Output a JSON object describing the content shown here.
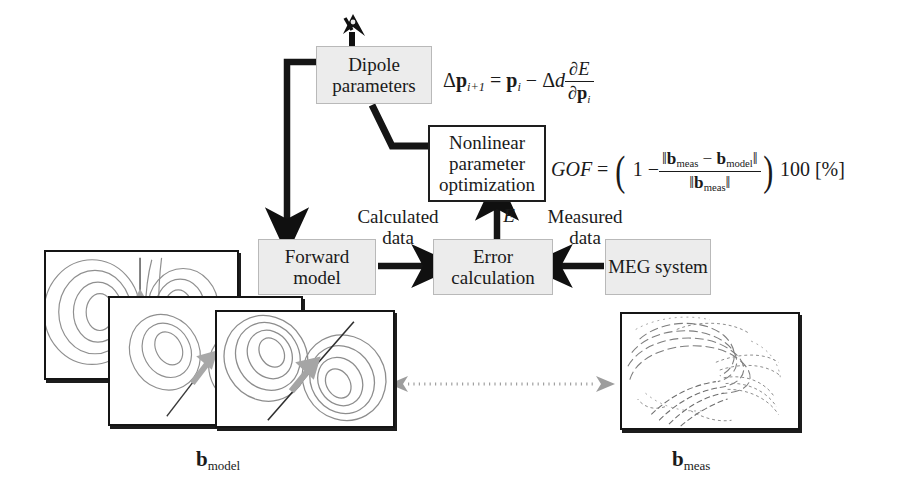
{
  "diagram": {
    "type": "flowchart",
    "colors": {
      "box_fill_grey": "#ececec",
      "box_fill_white": "#ffffff",
      "stroke_dark": "#1a1a1a",
      "arrow_grey": "#9a9a9a",
      "contour_grey": "#8d8d8d",
      "background": "#ffffff"
    }
  },
  "boxes": [
    {
      "id": "dipole-parameters",
      "label": "Dipole\nparameters",
      "fill": "grey"
    },
    {
      "id": "nonlinear-optimization",
      "label": "Nonlinear\nparameter\noptimization",
      "fill": "white"
    },
    {
      "id": "forward-model",
      "label": "Forward\nmodel",
      "fill": "grey"
    },
    {
      "id": "error-calculation",
      "label": "Error\ncalculation",
      "fill": "grey"
    },
    {
      "id": "meg-system",
      "label": "MEG\nsystem",
      "fill": "grey"
    }
  ],
  "edge_labels": {
    "calculated_data": "Calculated\ndata",
    "measured_data": "Measured\ndata",
    "error_symbol": "E"
  },
  "formulas": {
    "update_rule": {
      "lhs_delta": "Δ",
      "lhs_p": "p",
      "lhs_sub": "i+1",
      "eq": "=",
      "rhs_p": "p",
      "rhs_sub": "i",
      "minus": "−",
      "step_delta": "Δ",
      "step_d": "d",
      "grad_num": "∂E",
      "grad_den_partial": "∂",
      "grad_den_p": "p",
      "grad_den_sub": "i",
      "plain": "Δp_{i+1} = p_i − Δd ∂E/∂p_i"
    },
    "gof": {
      "name": "GOF",
      "eq": "=",
      "one": "1",
      "minus": "−",
      "num_b1": "b",
      "num_b1_sub": "meas",
      "num_minus": "−",
      "num_b2": "b",
      "num_b2_sub": "model",
      "den_b": "b",
      "den_b_sub": "meas",
      "scale": "100",
      "unit": "[%]",
      "plain": "GOF = (1 − ‖b_meas − b_model‖ / ‖b_meas‖) 100 [%]"
    }
  },
  "captions": {
    "model_b": "b",
    "model_sub": "model",
    "meas_b": "b",
    "meas_sub": "meas"
  },
  "field_maps": {
    "model_stack_count": 3,
    "model_description": "simulated dipolar field contour maps with source arrow",
    "measured_description": "measured noisy magnetic field contour map"
  }
}
